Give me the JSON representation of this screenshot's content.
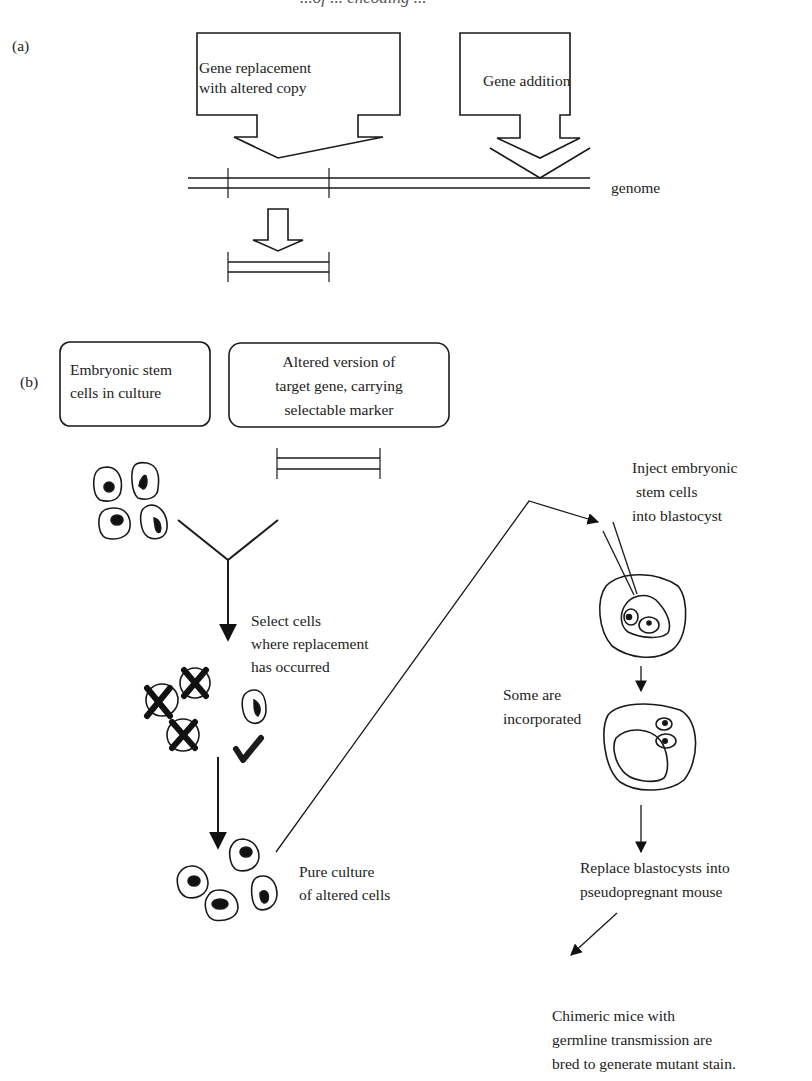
{
  "header": {
    "running_title": "...of ... encoding ..."
  },
  "panel_a": {
    "label": "(a)",
    "box_replacement": {
      "line1": "Gene replacement",
      "line2": "with altered copy"
    },
    "box_addition": {
      "label": "Gene addition"
    },
    "genome_label": "genome"
  },
  "panel_b": {
    "label": "(b)",
    "box_es_cells": {
      "line1": "Embryonic stem",
      "line2": "cells in culture"
    },
    "box_altered_gene": {
      "line1": "Altered version of",
      "line2": "target gene, carrying",
      "line3": "selectable marker"
    },
    "select_step": {
      "line1": "Select cells",
      "line2": "where replacement",
      "line3": "has occurred"
    },
    "pure_culture": {
      "line1": "Pure culture",
      "line2": "of altered cells"
    },
    "inject_step": {
      "line1": "Inject embryonic",
      "line2": " stem cells",
      "line3": "into blastocyst"
    },
    "incorporated": {
      "line1": "Some are",
      "line2": "incorporated"
    },
    "replace_step": {
      "line1": "Replace blastocysts into",
      "line2": "pseudopregnant mouse"
    },
    "outcome": {
      "line1": "Chimeric mice with",
      "line2": "germline transmission are",
      "line3": "bred to generate mutant stain."
    }
  },
  "colors": {
    "ink": "#1a1a1a",
    "background": "#ffffff"
  }
}
